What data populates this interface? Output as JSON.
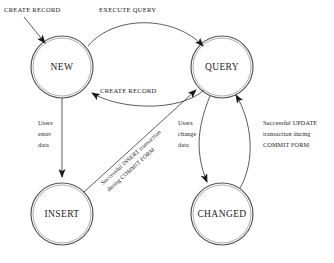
{
  "diagram": {
    "type": "state-diagram",
    "colors": {
      "background": "#ffffff",
      "node_stroke": "#555555",
      "edge_stroke": "#4a4a4a",
      "text": "#1a1a1a"
    },
    "nodes": [
      {
        "id": "new",
        "label": "NEW",
        "cx": 62,
        "cy": 67,
        "r": 31
      },
      {
        "id": "query",
        "label": "QUERY",
        "cx": 222,
        "cy": 67,
        "r": 31
      },
      {
        "id": "insert",
        "label": "INSERT",
        "cx": 62,
        "cy": 214,
        "r": 31
      },
      {
        "id": "changed",
        "label": "CHANGED",
        "cx": 222,
        "cy": 214,
        "r": 31
      }
    ],
    "edges": [
      {
        "id": "entry-create-record",
        "from": "",
        "to": "new",
        "label": "CREATE RECORD",
        "label_lines": [
          "CREATE RECORD"
        ]
      },
      {
        "id": "new-to-query",
        "from": "new",
        "to": "query",
        "label": "EXECUTE QUERY",
        "label_lines": [
          "EXECUTE QUERY"
        ]
      },
      {
        "id": "query-to-new",
        "from": "query",
        "to": "new",
        "label": "CREATE RECORD",
        "label_lines": [
          "CREATE RECORD"
        ]
      },
      {
        "id": "new-to-insert",
        "from": "new",
        "to": "insert",
        "label": "Users enter data",
        "label_lines": [
          "Users",
          "enter",
          "data"
        ]
      },
      {
        "id": "insert-to-query",
        "from": "insert",
        "to": "query",
        "label": "Successful INSERT transaction during COMMIT FORM",
        "label_lines": [
          "Successful INSERT transaction",
          "during COMMIT FORM"
        ]
      },
      {
        "id": "query-to-changed",
        "from": "query",
        "to": "changed",
        "label": "Users change data",
        "label_lines": [
          "Users",
          "change",
          "data"
        ]
      },
      {
        "id": "changed-to-query",
        "from": "changed",
        "to": "query",
        "label": "Successful UPDATE transaction during COMMIT FORM",
        "label_lines": [
          "Successful UPDATE",
          "transaction during",
          "COMMIT FORM"
        ]
      }
    ]
  }
}
